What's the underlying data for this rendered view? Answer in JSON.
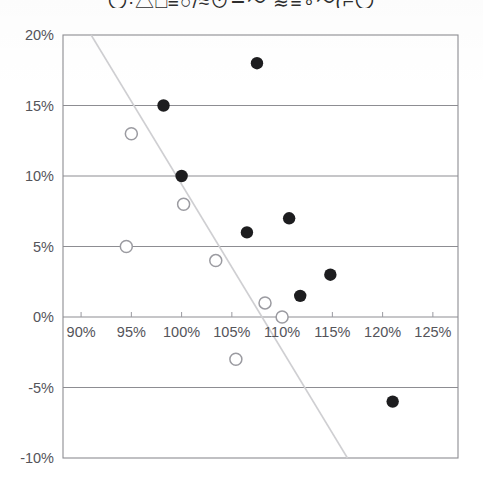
{
  "page": {
    "clipped_header_text": "〇·△□≡○/≈⊙∸〜 ≋≡∘〜(⌐〇",
    "background_color": "#ffffff"
  },
  "chart_data": {
    "type": "scatter",
    "title": "",
    "subtitle": "",
    "xlabel": "",
    "ylabel": "",
    "xlim": [
      88.2,
      127.5
    ],
    "ylim": [
      -10,
      20
    ],
    "x_ticks": [
      "90%",
      "95%",
      "100%",
      "105%",
      "110%",
      "115%",
      "120%",
      "125%"
    ],
    "x_tick_values": [
      90,
      95,
      100,
      105,
      110,
      115,
      120,
      125
    ],
    "y_ticks": [
      "20%",
      "15%",
      "10%",
      "5%",
      "0%",
      "-5%",
      "-10%"
    ],
    "y_tick_values": [
      20,
      15,
      10,
      5,
      0,
      -5,
      -10
    ],
    "grid": "horizontal",
    "legend": "none",
    "colors": {
      "filled_marker": "#1d1d1f",
      "open_marker_stroke": "#9b9ba1",
      "open_marker_fill": "#ffffff",
      "gridline": "#8d8d92",
      "trendline": "#cfcfd2",
      "axis_text": "#54545a"
    },
    "series": [
      {
        "name": "filled-markers",
        "marker": "filled-circle",
        "points": [
          {
            "x": 107.5,
            "y": 18
          },
          {
            "x": 98.2,
            "y": 15
          },
          {
            "x": 100.0,
            "y": 10
          },
          {
            "x": 110.7,
            "y": 7
          },
          {
            "x": 106.5,
            "y": 6
          },
          {
            "x": 114.8,
            "y": 3
          },
          {
            "x": 111.8,
            "y": 1.5
          },
          {
            "x": 121.0,
            "y": -6
          }
        ]
      },
      {
        "name": "open-markers",
        "marker": "open-circle",
        "points": [
          {
            "x": 95.0,
            "y": 13
          },
          {
            "x": 100.2,
            "y": 8
          },
          {
            "x": 94.5,
            "y": 5
          },
          {
            "x": 103.4,
            "y": 4
          },
          {
            "x": 108.3,
            "y": 1
          },
          {
            "x": 110.0,
            "y": 0
          },
          {
            "x": 105.4,
            "y": -3
          }
        ]
      }
    ],
    "trendline": {
      "name": "regression-line",
      "x_start": 91.0,
      "y_start": 20,
      "x_end": 116.5,
      "y_end": -10
    },
    "annotations": []
  }
}
